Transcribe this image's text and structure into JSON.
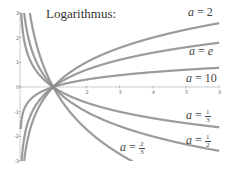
{
  "chart_data": {
    "type": "line",
    "title": "Logarithmus:",
    "xlabel": "",
    "ylabel": "",
    "xlim": [
      0,
      6
    ],
    "ylim": [
      -3,
      3
    ],
    "x_ticks": [
      2,
      3,
      4,
      5,
      6
    ],
    "y_ticks": [
      3,
      2,
      1,
      0,
      -1,
      -2,
      -3
    ],
    "grid": false,
    "series": [
      {
        "name": "a = 2",
        "base": 2,
        "label_text": "a = 2"
      },
      {
        "name": "a = e",
        "base": 2.718281828,
        "label_text": "a = e"
      },
      {
        "name": "a = 10",
        "base": 10,
        "label_text": "a = 10"
      },
      {
        "name": "a = 1/3",
        "base": 0.333333,
        "label_text": "a = 1/3"
      },
      {
        "name": "a = 1/2",
        "base": 0.5,
        "label_text": "a = 1/2"
      },
      {
        "name": "a = 2/3",
        "base": 0.666667,
        "label_text": "a = 2/3"
      }
    ],
    "sample_points": {
      "x": [
        0.125,
        0.25,
        0.5,
        1,
        2,
        3,
        4,
        5,
        6
      ],
      "a=2": [
        -3,
        -2,
        -1,
        0,
        1,
        1.585,
        2,
        2.322,
        2.585
      ],
      "a=e": [
        -2.079,
        -1.386,
        -0.693,
        0,
        0.693,
        1.099,
        1.386,
        1.609,
        1.792
      ],
      "a=10": [
        -0.903,
        -0.602,
        -0.301,
        0,
        0.301,
        0.477,
        0.602,
        0.699,
        0.778
      ],
      "a=1/3": [
        1.893,
        1.262,
        0.631,
        0,
        -0.631,
        -1,
        -1.262,
        -1.465,
        -1.631
      ],
      "a=1/2": [
        3,
        2,
        1,
        0,
        -1,
        -1.585,
        -2,
        -2.322,
        -2.585
      ],
      "a=2/3": [
        5.129,
        3.419,
        1.71,
        0,
        -1.71,
        -2.71,
        -3.419,
        -3.969,
        -4.419
      ]
    }
  },
  "labels": {
    "title": "Logarithmus:",
    "a2": {
      "var": "a",
      "eq": "=",
      "val": "2"
    },
    "ae": {
      "var": "a",
      "eq": "=",
      "val": "e"
    },
    "a10": {
      "var": "a",
      "eq": "=",
      "val": "10"
    },
    "a13": {
      "var": "a",
      "eq": "=",
      "num": "1",
      "den": "3"
    },
    "a12": {
      "var": "a",
      "eq": "=",
      "num": "1",
      "den": "2"
    },
    "a23": {
      "var": "a",
      "eq": "=",
      "num": "2",
      "den": "3"
    }
  },
  "ticks": {
    "x": [
      "2",
      "3",
      "4",
      "5",
      "6"
    ],
    "y": [
      "3",
      "2",
      "1",
      "0",
      "-1",
      "-2",
      "-3"
    ]
  },
  "colors": {
    "curve": "#8a8a8a",
    "axis": "#999999",
    "text": "#333333"
  }
}
